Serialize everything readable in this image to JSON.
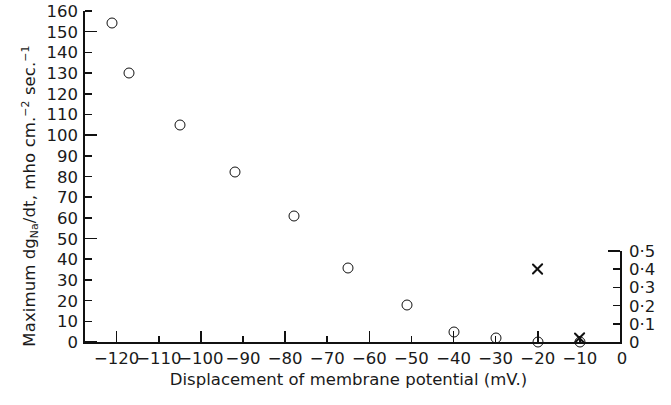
{
  "chart_data": {
    "type": "scatter",
    "title": "",
    "xlabel": "Displacement of membrane potential (mV.)",
    "ylabel_parts": {
      "pre": "Maximum dg",
      "sub1": "Na",
      "mid": "/dt, mho cm.",
      "sup1": "−2",
      "mid2": " sec.",
      "sup2": "−1"
    },
    "ylabel_plain": "Maximum dgNa/dt, mho cm.−2 sec.−1",
    "xlim": [
      -128,
      0
    ],
    "ylim": [
      0,
      160
    ],
    "ylim_right": [
      0,
      0.5
    ],
    "grid": false,
    "legend": "none",
    "xticks": [
      -120,
      -110,
      -100,
      -90,
      -80,
      -70,
      -60,
      -50,
      -40,
      -30,
      -20,
      -10,
      0
    ],
    "xticklabels": [
      "−120",
      "−110",
      "−100",
      "−90",
      "−80",
      "−70",
      "−60",
      "−50",
      "−40",
      "−30",
      "−20",
      "−10",
      "0"
    ],
    "yticks": [
      0,
      10,
      20,
      30,
      40,
      50,
      60,
      70,
      80,
      90,
      100,
      110,
      120,
      130,
      140,
      150,
      160
    ],
    "yticklabels": [
      "0",
      "10",
      "20",
      "30",
      "40",
      "50",
      "60",
      "70",
      "80",
      "90",
      "100",
      "110",
      "120",
      "130",
      "140",
      "150",
      "160"
    ],
    "rightticks": [
      0,
      0.1,
      0.2,
      0.3,
      0.4,
      0.5
    ],
    "rightticklabels": [
      "0",
      "0·1",
      "0·2",
      "0·3",
      "0·4",
      "0·5"
    ],
    "right_axis_span": [
      0,
      0.5
    ],
    "series": [
      {
        "name": "maximum dgNa/dt",
        "marker": "circle",
        "axis": "left",
        "points": [
          {
            "x": -121,
            "y": 154
          },
          {
            "x": -117,
            "y": 130
          },
          {
            "x": -105,
            "y": 105
          },
          {
            "x": -92,
            "y": 82
          },
          {
            "x": -78,
            "y": 61
          },
          {
            "x": -65,
            "y": 36
          },
          {
            "x": -51,
            "y": 18
          },
          {
            "x": -40,
            "y": 5
          },
          {
            "x": -30,
            "y": 2
          },
          {
            "x": -20,
            "y": 0
          },
          {
            "x": -10,
            "y": 0
          }
        ]
      },
      {
        "name": "secondary scale measurements",
        "marker": "cross",
        "axis": "right",
        "points": [
          {
            "x": -20,
            "y": 0.4
          },
          {
            "x": -10,
            "y": 0.02
          }
        ]
      }
    ]
  },
  "axes": {
    "x_axis_label": "Displacement of membrane potential (mV.)"
  }
}
